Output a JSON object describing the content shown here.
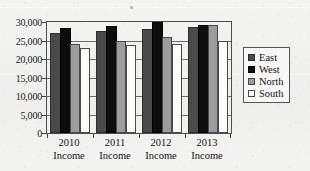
{
  "chart_data": {
    "type": "bar",
    "title": "",
    "subtitle": "",
    "xlabel": "",
    "ylabel": "",
    "categories": [
      "2010 Income",
      "2011 Income",
      "2012 Income",
      "2013 Income"
    ],
    "category_lines": [
      [
        "2010",
        "Income"
      ],
      [
        "2011",
        "Income"
      ],
      [
        "2012",
        "Income"
      ],
      [
        "2013",
        "Income"
      ]
    ],
    "series": [
      {
        "name": "East",
        "color": "#4a4a4a",
        "values": [
          27000,
          27500,
          28100,
          28700
        ]
      },
      {
        "name": "West",
        "color": "#0d0d0d",
        "values": [
          28400,
          29000,
          30000,
          29100
        ]
      },
      {
        "name": "North",
        "color": "#9d9d9d",
        "values": [
          24000,
          25000,
          26000,
          29100
        ]
      },
      {
        "name": "South",
        "color": "#fbfbfa",
        "values": [
          23000,
          23800,
          24100,
          25000
        ]
      }
    ],
    "ylim": [
      0,
      30000
    ],
    "ytick_values": [
      0,
      5000,
      10000,
      15000,
      20000,
      25000,
      30000
    ],
    "ytick_labels": [
      "0",
      "5,000",
      "10,000",
      "15,000",
      "20,000",
      "25,000",
      "30,000"
    ],
    "grid": true,
    "grid_axis": "y",
    "legend_position": "right",
    "legend_entries": [
      "East",
      "West",
      "North",
      "South"
    ]
  }
}
